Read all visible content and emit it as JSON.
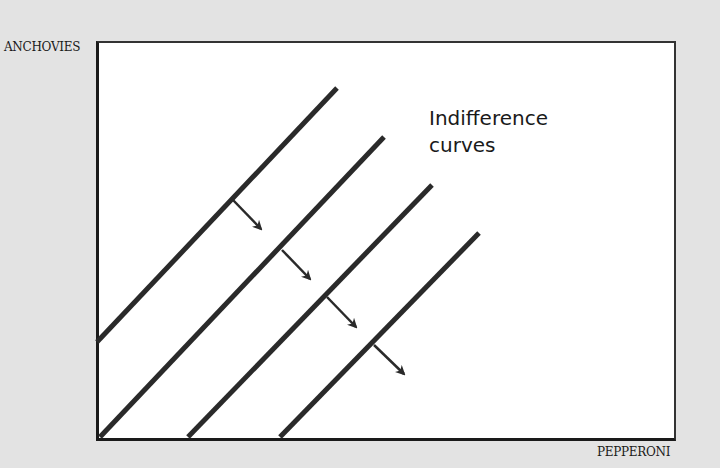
{
  "diagram": {
    "type": "indifference-curves",
    "y_axis_label": "ANCHOVIES",
    "x_axis_label": "PEPPERONI",
    "annotation_line1": "Indifference",
    "annotation_line2": "curves",
    "colors": {
      "background": "#e3e3e3",
      "plot": "#ffffff",
      "ink": "#2a2a2a"
    },
    "curves": [
      {
        "x1": 97,
        "y1": 342,
        "x2": 337,
        "y2": 88
      },
      {
        "x1": 100,
        "y1": 437,
        "x2": 384,
        "y2": 137
      },
      {
        "x1": 188,
        "y1": 437,
        "x2": 432,
        "y2": 185
      },
      {
        "x1": 280,
        "y1": 437,
        "x2": 479,
        "y2": 233
      }
    ],
    "arrows": [
      {
        "x1": 233,
        "y1": 200,
        "x2": 261,
        "y2": 229
      },
      {
        "x1": 282,
        "y1": 250,
        "x2": 310,
        "y2": 279
      },
      {
        "x1": 327,
        "y1": 297,
        "x2": 356,
        "y2": 327
      },
      {
        "x1": 374,
        "y1": 345,
        "x2": 404,
        "y2": 374
      }
    ],
    "arrow_meaning": "direction of increasing preference (more pepperoni, less anchovies)"
  }
}
